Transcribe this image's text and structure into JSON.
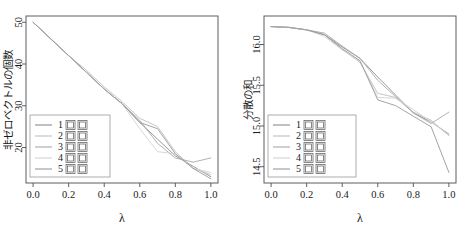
{
  "figure": {
    "background_color": "#ffffff",
    "panel_count": 2
  },
  "chart_data": [
    {
      "type": "line",
      "panel": "left",
      "title": "",
      "xlabel": "λ",
      "ylabel": "非ゼロベクトルの個数",
      "xlim": [
        -0.04,
        1.04
      ],
      "ylim": [
        11.5,
        51.5
      ],
      "xticks": [
        0.0,
        0.2,
        0.4,
        0.6,
        0.8,
        1.0
      ],
      "xticklabels": [
        "0.0",
        "0.2",
        "0.4",
        "0.6",
        "0.8",
        "1.0"
      ],
      "yticks": [
        20,
        30,
        40,
        50
      ],
      "yticklabels": [
        "20",
        "30",
        "40",
        "50"
      ],
      "grid": false,
      "legend_position": "bottom-left",
      "x": [
        0.0,
        0.1,
        0.2,
        0.3,
        0.4,
        0.5,
        0.6,
        0.7,
        0.8,
        0.9,
        1.0
      ],
      "series": [
        {
          "name": "1 回目",
          "color": "#8c8c8c",
          "values": [
            50,
            46,
            42,
            38,
            34,
            30.5,
            26,
            22,
            18,
            15.5,
            13
          ]
        },
        {
          "name": "2 回目",
          "color": "#c0c0c0",
          "values": [
            50,
            46,
            42,
            38.5,
            34.5,
            31,
            27,
            25,
            19,
            15,
            13.5
          ]
        },
        {
          "name": "3 回目",
          "color": "#a8a8a8",
          "values": [
            50,
            46,
            42,
            38,
            34,
            30.5,
            26.5,
            21,
            17.5,
            16.5,
            17.5
          ]
        },
        {
          "name": "4 回目",
          "color": "#d2d2d2",
          "values": [
            50,
            46,
            42,
            38,
            34,
            30.5,
            24.5,
            19,
            18.5,
            15,
            14
          ]
        },
        {
          "name": "5 回目",
          "color": "#999999",
          "values": [
            50,
            46,
            42,
            38,
            34,
            30.5,
            26,
            24.5,
            18.5,
            15,
            12.5
          ]
        }
      ],
      "legend_entries": [
        "1 回目",
        "2 回目",
        "3 回目",
        "4 回目",
        "5 回目"
      ]
    },
    {
      "type": "line",
      "panel": "right",
      "title": "",
      "xlabel": "λ",
      "ylabel": "分散の和",
      "xlim": [
        -0.04,
        1.04
      ],
      "ylim": [
        14.3,
        16.35
      ],
      "xticks": [
        0.0,
        0.2,
        0.4,
        0.6,
        0.8,
        1.0
      ],
      "xticklabels": [
        "0.0",
        "0.2",
        "0.4",
        "0.6",
        "0.8",
        "1.0"
      ],
      "yticks": [
        14.5,
        15.0,
        15.5,
        16.0
      ],
      "yticklabels": [
        "14.5",
        "15.0",
        "15.5",
        "16.0"
      ],
      "grid": false,
      "legend_position": "bottom-left",
      "x": [
        0.0,
        0.1,
        0.2,
        0.3,
        0.4,
        0.5,
        0.6,
        0.7,
        0.8,
        0.9,
        1.0
      ],
      "series": [
        {
          "name": "1 回目",
          "color": "#8c8c8c",
          "values": [
            16.22,
            16.21,
            16.18,
            16.12,
            15.97,
            15.83,
            15.6,
            15.38,
            15.16,
            15.05,
            14.9
          ]
        },
        {
          "name": "2 回目",
          "color": "#c0c0c0",
          "values": [
            16.22,
            16.21,
            16.18,
            16.12,
            15.94,
            15.78,
            15.4,
            15.35,
            15.17,
            15.07,
            14.88
          ]
        },
        {
          "name": "3 回目",
          "color": "#a8a8a8",
          "values": [
            16.22,
            16.21,
            16.18,
            16.14,
            15.98,
            15.83,
            15.56,
            15.36,
            15.16,
            15.03,
            15.17
          ]
        },
        {
          "name": "4 回目",
          "color": "#d2d2d2",
          "values": [
            16.22,
            16.21,
            16.18,
            16.1,
            15.93,
            15.8,
            15.35,
            15.34,
            15.2,
            15.05,
            14.89
          ]
        },
        {
          "name": "5 回目",
          "color": "#999999",
          "values": [
            16.22,
            16.21,
            16.18,
            16.12,
            15.95,
            15.8,
            15.32,
            15.25,
            15.12,
            14.99,
            14.43
          ]
        }
      ],
      "legend_entries": [
        "1 回目",
        "2 回目",
        "3 回目",
        "4 回目",
        "5 回目"
      ]
    }
  ]
}
